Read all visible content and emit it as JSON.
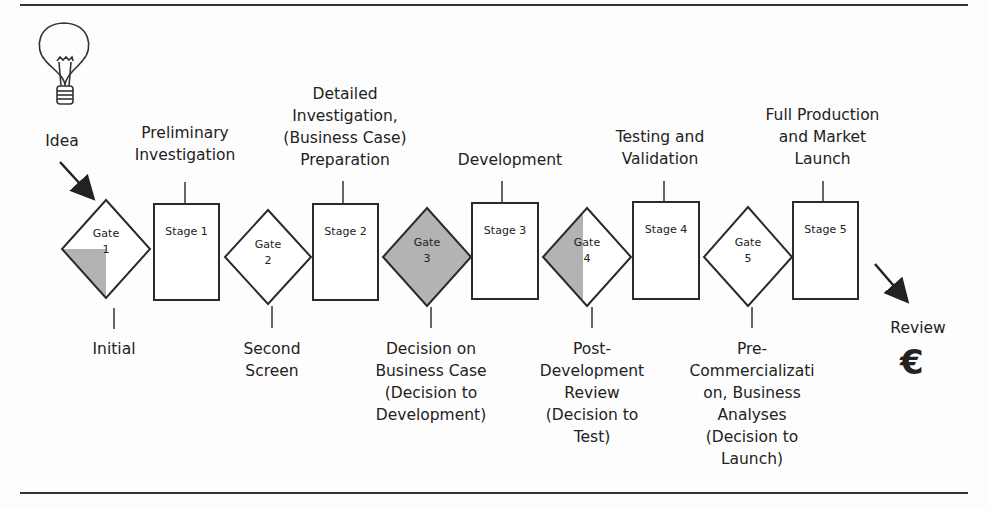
{
  "diagram": {
    "type": "stage-gate process",
    "start": {
      "label": "Idea",
      "icon": "lightbulb-icon"
    },
    "end": {
      "label": "Review",
      "icon": "euro-icon",
      "symbol": "€"
    },
    "stages": [
      {
        "id": "Stage 1",
        "description": "Preliminary\nInvestigation"
      },
      {
        "id": "Stage 2",
        "description": "Detailed\nInvestigation,\n(Business Case)\nPreparation"
      },
      {
        "id": "Stage 3",
        "description": "Development"
      },
      {
        "id": "Stage 4",
        "description": "Testing and\nValidation"
      },
      {
        "id": "Stage 5",
        "description": "Full Production\nand Market\nLaunch"
      }
    ],
    "gates": [
      {
        "id": "Gate\n1",
        "description": "Initial",
        "fill": "quarter-bottom-left"
      },
      {
        "id": "Gate\n2",
        "description": "Second\nScreen",
        "fill": "none"
      },
      {
        "id": "Gate\n3",
        "description": "Decision on\nBusiness Case\n(Decision to\nDevelopment)",
        "fill": "full"
      },
      {
        "id": "Gate\n4",
        "description": "Post-\nDevelopment\nReview\n(Decision to\nTest)",
        "fill": "left-half"
      },
      {
        "id": "Gate\n5",
        "description": "Pre-\nCommercializati\non, Business\nAnalyses\n(Decision to\nLaunch)",
        "fill": "none"
      }
    ],
    "colors": {
      "stroke": "#2a2a2a",
      "shade": "#b3b3b3",
      "background": "#fdfdfd"
    }
  }
}
